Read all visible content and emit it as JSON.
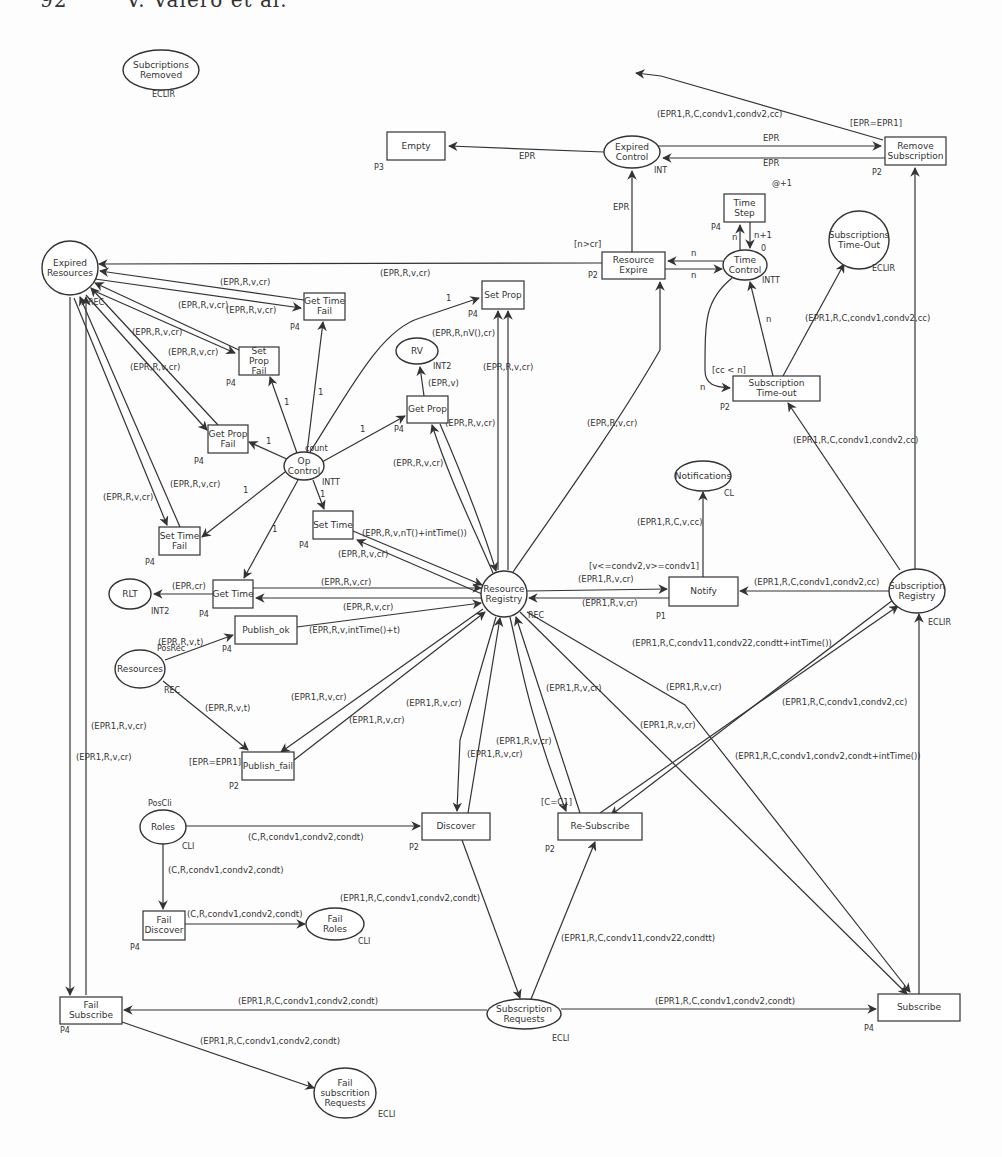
{
  "page_header": "92        V. Valero et al.",
  "places": [
    {
      "id": "subscriptions_removed",
      "label": [
        "Subcriptions",
        "Removed"
      ],
      "cx": 161,
      "cy": 70,
      "rx": 38,
      "ry": 20,
      "tag": "ECLIR",
      "tx": 152,
      "ty": 97
    },
    {
      "id": "expired_control",
      "label": [
        "Expired",
        "Control"
      ],
      "cx": 632,
      "cy": 152,
      "rx": 28,
      "ry": 16,
      "tag": "INT",
      "tx": 654,
      "ty": 173
    },
    {
      "id": "expired_resources",
      "label": [
        "Expired",
        "Resources"
      ],
      "cx": 70,
      "cy": 268,
      "rx": 28,
      "ry": 27,
      "tag": "REC",
      "tx": 88,
      "ty": 305
    },
    {
      "id": "time_control",
      "label": [
        "Time",
        "Control"
      ],
      "cx": 745,
      "cy": 265,
      "rx": 22,
      "ry": 15,
      "tag": "INTT",
      "tx": 762,
      "ty": 283
    },
    {
      "id": "subscriptions_timeout",
      "label": [
        "Subscriptions",
        "Time-Out"
      ],
      "cx": 859,
      "cy": 240,
      "rx": 30,
      "ry": 29,
      "tag": "ECLIR",
      "tx": 872,
      "ty": 271
    },
    {
      "id": "rv",
      "label": [
        "RV"
      ],
      "cx": 417,
      "cy": 351,
      "rx": 21,
      "ry": 13,
      "tag": "INT2",
      "tx": 433,
      "ty": 369
    },
    {
      "id": "op_control",
      "label": [
        "Op",
        "Control"
      ],
      "cx": 304,
      "cy": 466,
      "rx": 20,
      "ry": 14,
      "tag": "INTT",
      "tx": 322,
      "ty": 485
    },
    {
      "id": "notifications",
      "label": [
        "Notifications"
      ],
      "cx": 703,
      "cy": 476,
      "rx": 28,
      "ry": 15,
      "tag": "CL",
      "tx": 724,
      "ty": 496
    },
    {
      "id": "resource_registry",
      "label": [
        "Resource",
        "Registry"
      ],
      "cx": 504,
      "cy": 594,
      "rx": 23,
      "ry": 23,
      "tag": "REC",
      "tx": 528,
      "ty": 618
    },
    {
      "id": "subscription_registry",
      "label": [
        "Subscription",
        "Registry"
      ],
      "cx": 917,
      "cy": 591,
      "rx": 28,
      "ry": 22,
      "tag": "ECLIR",
      "tx": 928,
      "ty": 625
    },
    {
      "id": "rlt",
      "label": [
        "RLT"
      ],
      "cx": 130,
      "cy": 594,
      "rx": 21,
      "ry": 15,
      "tag": "INT2",
      "tx": 151,
      "ty": 614
    },
    {
      "id": "resources",
      "label": [
        "Resources"
      ],
      "cx": 140,
      "cy": 669,
      "rx": 25,
      "ry": 19,
      "tag": "REC",
      "tx": 164,
      "ty": 693
    },
    {
      "id": "roles",
      "label": [
        "Roles"
      ],
      "cx": 163,
      "cy": 827,
      "rx": 23,
      "ry": 17,
      "tag": "CLI",
      "tx": 182,
      "ty": 849
    },
    {
      "id": "fail_roles",
      "label": [
        "Fail",
        "Roles"
      ],
      "cx": 335,
      "cy": 924,
      "rx": 29,
      "ry": 16,
      "tag": "CLI",
      "tx": 358,
      "ty": 944
    },
    {
      "id": "subscription_requests",
      "label": [
        "Subscription",
        "Requests"
      ],
      "cx": 524,
      "cy": 1014,
      "rx": 37,
      "ry": 15,
      "tag": "ECLI",
      "tx": 552,
      "ty": 1041
    },
    {
      "id": "fail_subscription_requests",
      "label": [
        "Fail",
        "subscrition",
        "Requests"
      ],
      "cx": 345,
      "cy": 1093,
      "rx": 31,
      "ry": 25,
      "tag": "ECLI",
      "tx": 378,
      "ty": 1117
    }
  ],
  "transitions": [
    {
      "id": "empty",
      "label": [
        "Empty"
      ],
      "x": 387,
      "y": 132,
      "w": 58,
      "h": 28,
      "tag": "P3",
      "tx": 374,
      "ty": 170
    },
    {
      "id": "remove_subscription",
      "label": [
        "Remove",
        "Subscription"
      ],
      "x": 885,
      "y": 137,
      "w": 61,
      "h": 28,
      "tag": "P2",
      "tx": 872,
      "ty": 175
    },
    {
      "id": "time_step",
      "label": [
        "Time",
        "Step"
      ],
      "x": 724,
      "y": 194,
      "w": 41,
      "h": 28,
      "tag": "P4",
      "tx": 711,
      "ty": 230
    },
    {
      "id": "resource_expire",
      "label": [
        "Resource",
        "Expire"
      ],
      "x": 602,
      "y": 252,
      "w": 63,
      "h": 27,
      "tag": "P2",
      "tx": 588,
      "ty": 278
    },
    {
      "id": "get_time_fail",
      "label": [
        "Get Time",
        "Fail"
      ],
      "x": 304,
      "y": 293,
      "w": 41,
      "h": 27,
      "tag": "P4",
      "tx": 290,
      "ty": 330
    },
    {
      "id": "set_prop",
      "label": [
        "Set Prop"
      ],
      "x": 482,
      "y": 281,
      "w": 42,
      "h": 28,
      "tag": "P4",
      "tx": 468,
      "ty": 317
    },
    {
      "id": "set_prop_fail",
      "label": [
        "Set",
        "Prop",
        "Fail"
      ],
      "x": 239,
      "y": 347,
      "w": 40,
      "h": 28,
      "tag": "P4",
      "tx": 226,
      "ty": 386
    },
    {
      "id": "subscription_timeout",
      "label": [
        "Subscription",
        "Time-out"
      ],
      "x": 733,
      "y": 376,
      "w": 87,
      "h": 25,
      "tag": "P2",
      "tx": 720,
      "ty": 410
    },
    {
      "id": "get_prop",
      "label": [
        "Get Prop"
      ],
      "x": 407,
      "y": 396,
      "w": 41,
      "h": 27,
      "tag": "P4",
      "tx": 394,
      "ty": 432
    },
    {
      "id": "get_prop_fail",
      "label": [
        "Get Prop",
        "Fail"
      ],
      "x": 208,
      "y": 425,
      "w": 40,
      "h": 28,
      "tag": "P4",
      "tx": 194,
      "ty": 464
    },
    {
      "id": "set_time",
      "label": [
        "Set Time"
      ],
      "x": 313,
      "y": 511,
      "w": 40,
      "h": 28,
      "tag": "P4",
      "tx": 299,
      "ty": 548
    },
    {
      "id": "set_time_fail",
      "label": [
        "Set Time",
        "Fail"
      ],
      "x": 159,
      "y": 527,
      "w": 41,
      "h": 28,
      "tag": "P4",
      "tx": 145,
      "ty": 565
    },
    {
      "id": "get_time",
      "label": [
        "Get Time"
      ],
      "x": 213,
      "y": 580,
      "w": 40,
      "h": 28,
      "tag": "P4",
      "tx": 199,
      "ty": 617
    },
    {
      "id": "notify",
      "label": [
        "Notify"
      ],
      "x": 669,
      "y": 577,
      "w": 69,
      "h": 29,
      "tag": "P1",
      "tx": 656,
      "ty": 619
    },
    {
      "id": "publish_ok",
      "label": [
        "Publish_ok"
      ],
      "x": 235,
      "y": 616,
      "w": 62,
      "h": 28,
      "tag": "P4",
      "tx": 222,
      "ty": 652
    },
    {
      "id": "publish_fail",
      "label": [
        "Publish_fail"
      ],
      "x": 242,
      "y": 752,
      "w": 52,
      "h": 28,
      "tag": "P2",
      "tx": 229,
      "ty": 789
    },
    {
      "id": "discover",
      "label": [
        "Discover"
      ],
      "x": 422,
      "y": 813,
      "w": 68,
      "h": 27,
      "tag": "P2",
      "tx": 409,
      "ty": 850
    },
    {
      "id": "re_subscribe",
      "label": [
        "Re-Subscribe"
      ],
      "x": 558,
      "y": 813,
      "w": 84,
      "h": 27,
      "tag": "P2",
      "tx": 545,
      "ty": 852
    },
    {
      "id": "fail_discover",
      "label": [
        "Fail",
        "Discover"
      ],
      "x": 143,
      "y": 911,
      "w": 42,
      "h": 29,
      "tag": "P4",
      "tx": 130,
      "ty": 950
    },
    {
      "id": "fail_subscribe",
      "label": [
        "Fail",
        "Subscribe"
      ],
      "x": 60,
      "y": 997,
      "w": 62,
      "h": 27,
      "tag": "P4",
      "tx": 60,
      "ty": 1033
    },
    {
      "id": "subscribe",
      "label": [
        "Subscribe"
      ],
      "x": 878,
      "y": 994,
      "w": 82,
      "h": 27,
      "tag": "P4",
      "tx": 864,
      "ty": 1031
    }
  ],
  "arcs": [
    {
      "d": "M883,140 L661,76 L636,73",
      "arrow": "end",
      "label": "(EPR1,R,C,condv1,condv2,cc)",
      "lx": 657,
      "ly": 117
    },
    {
      "d": "M658,146 L881,146",
      "arrow": "end",
      "label": "EPR",
      "lx": 763,
      "ly": 141
    },
    {
      "d": "M885,158 L663,158",
      "arrow": "end",
      "label": "EPR",
      "lx": 763,
      "ly": 166
    },
    {
      "d": "M604,152 L449,146",
      "arrow": "end",
      "label": "EPR",
      "lx": 519,
      "ly": 159
    },
    {
      "d": "M632,252 L632,171",
      "arrow": "end",
      "label": "EPR",
      "lx": 613,
      "ly": 210
    },
    {
      "d": "M915,593 L915,168",
      "arrow": "end",
      "label": "",
      "lx": 0,
      "ly": 0
    },
    {
      "d": "M740,250 L740,225",
      "arrow": "end",
      "label": "n",
      "lx": 732,
      "ly": 240
    },
    {
      "d": "M750,222 L750,248",
      "arrow": "end",
      "label": "n+1",
      "lx": 754,
      "ly": 238
    },
    {
      "d": "M723,261 L668,261",
      "arrow": "end",
      "label": "n",
      "lx": 691,
      "ly": 256
    },
    {
      "d": "M665,269 L722,269",
      "arrow": "end",
      "label": "n",
      "lx": 691,
      "ly": 278
    },
    {
      "d": "M732,278 C705,300 705,320 705,370 C705,385 715,387 730,388",
      "arrow": "end",
      "label": "n",
      "lx": 700,
      "ly": 390
    },
    {
      "d": "M773,376 L750,282",
      "arrow": "end",
      "label": "n",
      "lx": 766,
      "ly": 322
    },
    {
      "d": "M783,376 L844,264",
      "arrow": "end",
      "label": "(EPR1,R,C,condv1,condv2,cc)",
      "lx": 805,
      "ly": 321
    },
    {
      "d": "M900,570 L788,403",
      "arrow": "end",
      "label": "(EPR1,R,C,condv1,condv2,cc)",
      "lx": 793,
      "ly": 443
    },
    {
      "d": "M602,263 L99,264",
      "arrow": "end",
      "label": "(EPR,R,v,cr)",
      "lx": 380,
      "ly": 276
    },
    {
      "d": "M304,300 L100,271",
      "arrow": "end",
      "label": "(EPR,R,v,cr)",
      "lx": 220,
      "ly": 285
    },
    {
      "d": "M95,279 L301,308",
      "arrow": "end",
      "label": "(EPR,R,v,cr)",
      "lx": 226,
      "ly": 313
    },
    {
      "d": "M239,350 L95,283",
      "arrow": "end",
      "label": "(EPR,R,v,cr)",
      "lx": 178,
      "ly": 308
    },
    {
      "d": "M92,290 L235,353",
      "arrow": "end",
      "label": "(EPR,R,v,cr)",
      "lx": 168,
      "ly": 355
    },
    {
      "d": "M218,425 L91,288",
      "arrow": "end",
      "label": "(EPR,R,v,cr)",
      "lx": 132,
      "ly": 335
    },
    {
      "d": "M86,295 L207,430",
      "arrow": "end",
      "label": "(EPR,R,v,cr)",
      "lx": 130,
      "ly": 370
    },
    {
      "d": "M180,527 L80,297",
      "arrow": "end",
      "label": "(EPR,R,v,cr)",
      "lx": 170,
      "ly": 487
    },
    {
      "d": "M74,298 L167,525",
      "arrow": "end",
      "label": "(EPR,R,v,cr)",
      "lx": 103,
      "ly": 500
    },
    {
      "d": "M70,297 L70,995",
      "arrow": "end",
      "label": "(EPR1,R,v,cr)",
      "lx": 91,
      "ly": 729
    },
    {
      "d": "M86,995 L86,297",
      "arrow": "end",
      "label": "(EPR1,R,v,cr)",
      "lx": 76,
      "ly": 760
    },
    {
      "d": "M289,460 L249,442",
      "arrow": "end",
      "label": "1",
      "lx": 266,
      "ly": 444
    },
    {
      "d": "M297,453 L270,377",
      "arrow": "end",
      "label": "1",
      "lx": 284,
      "ly": 405
    },
    {
      "d": "M307,452 L323,322",
      "arrow": "end",
      "label": "1",
      "lx": 318,
      "ly": 395
    },
    {
      "d": "M310,452 C350,390 380,330 420,318 L479,298",
      "arrow": "end",
      "label": "1",
      "lx": 446,
      "ly": 301
    },
    {
      "d": "M322,462 L405,416",
      "arrow": "end",
      "label": "1",
      "lx": 360,
      "ly": 432
    },
    {
      "d": "M285,472 L202,537",
      "arrow": "end",
      "label": "1",
      "lx": 243,
      "ly": 493
    },
    {
      "d": "M313,480 L324,509",
      "arrow": "end",
      "label": "1",
      "lx": 320,
      "ly": 497
    },
    {
      "d": "M298,480 L244,578",
      "arrow": "end",
      "label": "1",
      "lx": 272,
      "ly": 532
    },
    {
      "d": "M424,396 L420,367",
      "arrow": "end",
      "label": "(EPR,v)",
      "lx": 428,
      "ly": 386
    },
    {
      "d": "M498,570 L498,311",
      "arrow": "end",
      "label": "(EPR,R,v,cr)",
      "lx": 483,
      "ly": 370
    },
    {
      "d": "M508,311 L508,570",
      "arrow": "start",
      "label": "(EPR,R,nV(),cr)",
      "lx": 432,
      "ly": 336
    },
    {
      "d": "M440,424 C460,470 480,520 496,571",
      "arrow": "end",
      "label": "(EPR,R,v,cr)",
      "lx": 445,
      "ly": 426
    },
    {
      "d": "M493,573 C470,520 450,480 432,425",
      "arrow": "end",
      "label": "(EPR,R,v,cr)",
      "lx": 393,
      "ly": 466
    },
    {
      "d": "M513,572 C570,490 620,420 660,350 L660,282",
      "arrow": "end",
      "label": "(EPR,R,v,cr)",
      "lx": 587,
      "ly": 426
    },
    {
      "d": "M353,531 L482,585",
      "arrow": "end",
      "label": "(EPR,R,v,nT()+intTime())",
      "lx": 362,
      "ly": 536
    },
    {
      "d": "M482,594 L357,540",
      "arrow": "end",
      "label": "(EPR,R,v,cr)",
      "lx": 338,
      "ly": 557
    },
    {
      "d": "M253,588 L481,588",
      "arrow": "end",
      "label": "(EPR,R,v,cr)",
      "lx": 321,
      "ly": 585
    },
    {
      "d": "M481,598 L256,598",
      "arrow": "end",
      "label": "(EPR,R,v,cr)",
      "lx": 343,
      "ly": 610
    },
    {
      "d": "M213,594 L154,594",
      "arrow": "end",
      "label": "(EPR,cr)",
      "lx": 172,
      "ly": 589
    },
    {
      "d": "M297,627 L481,603",
      "arrow": "end",
      "label": "(EPR,R,v,intTime()+t)",
      "lx": 309,
      "ly": 633
    },
    {
      "d": "M165,660 L233,635",
      "arrow": "end",
      "label": "(EPR,R,v,t)",
      "lx": 158,
      "ly": 645
    },
    {
      "d": "M163,681 L248,750",
      "arrow": "end",
      "label": "(EPR,R,v,t)",
      "lx": 205,
      "ly": 711
    },
    {
      "d": "M483,609 L281,752",
      "arrow": "end",
      "label": "(EPR1,R,v,cr)",
      "lx": 291,
      "ly": 700
    },
    {
      "d": "M294,760 L485,612",
      "arrow": "end",
      "label": "(EPR1,R,v,cr)",
      "lx": 349,
      "ly": 723
    },
    {
      "d": "M496,617 L460,740 L457,811",
      "arrow": "end",
      "label": "(EPR1,R,v,cr)",
      "lx": 406,
      "ly": 706
    },
    {
      "d": "M468,813 L500,618",
      "arrow": "end",
      "label": "(EPR1,R,v,cr)",
      "lx": 467,
      "ly": 757
    },
    {
      "d": "M510,617 C520,660 530,720 566,811",
      "arrow": "end",
      "label": "(EPR1,R,v,cr)",
      "lx": 546,
      "ly": 691
    },
    {
      "d": "M580,813 L516,617",
      "arrow": "end",
      "label": "(EPR1,R,v,cr)",
      "lx": 496,
      "ly": 744
    },
    {
      "d": "M527,612 L685,705 L910,992",
      "arrow": "end",
      "label": "(EPR1,R,v,cr)",
      "lx": 666,
      "ly": 690
    },
    {
      "d": "M520,612 L907,994",
      "arrow": "end",
      "label": "(EPR1,R,v,cr)",
      "lx": 640,
      "ly": 728
    },
    {
      "d": "M600,813 L898,606",
      "arrow": "end",
      "label": "(EPR1,R,C,condv1,condv2,cc)",
      "lx": 782,
      "ly": 705
    },
    {
      "d": "M893,600 L611,815",
      "arrow": "end",
      "label": "(EPR1,R,C,condv11,condv22,condtt+intTime())",
      "lx": 632,
      "ly": 646
    },
    {
      "d": "M919,994 L919,614",
      "arrow": "end",
      "label": "(EPR1,R,C,condv1,condv2,condt+intTime())",
      "lx": 735,
      "ly": 759
    },
    {
      "d": "M527,591 L667,589",
      "arrow": "end",
      "label": "(EPR1,R,v,cr)",
      "lx": 578,
      "ly": 582
    },
    {
      "d": "M669,598 L529,598",
      "arrow": "end",
      "label": "(EPR1,R,v,cr)",
      "lx": 582,
      "ly": 606
    },
    {
      "d": "M703,577 L703,492",
      "arrow": "end",
      "label": "(EPR1,R,C,v,cc)",
      "lx": 637,
      "ly": 525
    },
    {
      "d": "M889,591 L740,591",
      "arrow": "end",
      "label": "(EPR1,R,C,condv1,condv2,cc)",
      "lx": 754,
      "ly": 585
    },
    {
      "d": "M186,826 L420,826",
      "arrow": "end",
      "label": "(C,R,condv1,condv2,condt)",
      "lx": 248,
      "ly": 840
    },
    {
      "d": "M163,844 L163,909",
      "arrow": "end",
      "label": "(C,R,condv1,condv2,condt)",
      "lx": 168,
      "ly": 873
    },
    {
      "d": "M185,924 L305,924",
      "arrow": "end",
      "label": "(C,R,condv1,condv2,condt)",
      "lx": 187,
      "ly": 917
    },
    {
      "d": "M462,840 L520,998",
      "arrow": "end",
      "label": "(EPR1,R,C,condv1,condv2,condt)",
      "lx": 340,
      "ly": 901
    },
    {
      "d": "M531,999 L595,842",
      "arrow": "end",
      "label": "(EPR1,R,C,condv11,condv22,condtt)",
      "lx": 561,
      "ly": 941
    },
    {
      "d": "M487,1010 L124,1010",
      "arrow": "end",
      "label": "(EPR1,R,C,condv1,condv2,condt)",
      "lx": 238,
      "ly": 1004
    },
    {
      "d": "M561,1009 L876,1009",
      "arrow": "end",
      "label": "(EPR1,R,C,condv1,condv2,condt)",
      "lx": 655,
      "ly": 1004
    },
    {
      "d": "M122,1022 L314,1088",
      "arrow": "end",
      "label": "(EPR1,R,C,condv1,condv2,condt)",
      "lx": 200,
      "ly": 1044
    }
  ],
  "guards": [
    {
      "text": "[EPR=EPR1]",
      "x": 850,
      "y": 126
    },
    {
      "text": "[n>cr]",
      "x": 574,
      "y": 247
    },
    {
      "text": "[cc < n]",
      "x": 712,
      "y": 373
    },
    {
      "text": "[v<=condv2,v>=condv1]",
      "x": 589,
      "y": 569
    },
    {
      "text": "[EPR=EPR1]",
      "x": 189,
      "y": 765
    },
    {
      "text": "[C=C1]",
      "x": 541,
      "y": 805
    }
  ],
  "annotations": [
    {
      "text": "@+1",
      "x": 772,
      "y": 186
    },
    {
      "text": "0",
      "x": 761,
      "y": 251
    },
    {
      "text": "count",
      "x": 305,
      "y": 451
    },
    {
      "text": "PosRec",
      "x": 157,
      "y": 651
    },
    {
      "text": "PosCli",
      "x": 148,
      "y": 806
    }
  ]
}
